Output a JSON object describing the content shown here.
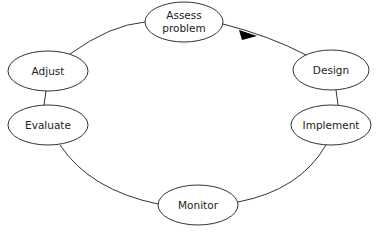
{
  "diagram": {
    "type": "cycle",
    "nodes": [
      {
        "id": "assess",
        "lines": [
          "Assess",
          "problem"
        ],
        "cx": 184,
        "cy": 22,
        "rx": 39,
        "ry": 20
      },
      {
        "id": "design",
        "lines": [
          "Design"
        ],
        "cx": 331,
        "cy": 70,
        "rx": 38,
        "ry": 20
      },
      {
        "id": "implement",
        "lines": [
          "Implement"
        ],
        "cx": 331,
        "cy": 125,
        "rx": 40,
        "ry": 20
      },
      {
        "id": "monitor",
        "lines": [
          "Monitor"
        ],
        "cx": 198,
        "cy": 205,
        "rx": 40,
        "ry": 20
      },
      {
        "id": "evaluate",
        "lines": [
          "Evaluate"
        ],
        "cx": 48,
        "cy": 125,
        "rx": 40,
        "ry": 20
      },
      {
        "id": "adjust",
        "lines": [
          "Adjust"
        ],
        "cx": 48,
        "cy": 71,
        "rx": 40,
        "ry": 20
      }
    ],
    "direction": "clockwise",
    "arrow_color": "#000000",
    "line_color": "#333333"
  }
}
